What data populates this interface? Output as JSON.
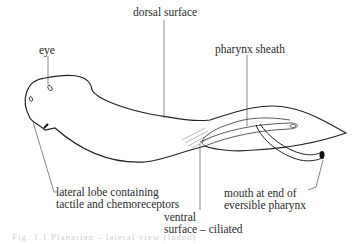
{
  "labels": {
    "dorsal_surface": "dorsal surface",
    "eye": "eye",
    "pharynx_sheath": "pharynx sheath",
    "lateral_lobe_line1": "lateral lobe containing",
    "lateral_lobe_line2": "tactile and chemoreceptors",
    "ventral_line1": "ventral",
    "ventral_line2": "surface – ciliated",
    "mouth_line1": "mouth at end of",
    "mouth_line2": "eversible pharynx"
  },
  "caption": "Fig. 1.1 Planarian – lateral view (faded)",
  "colors": {
    "stroke": "#222222",
    "leader": "#555555",
    "text": "#2a2a2a"
  }
}
